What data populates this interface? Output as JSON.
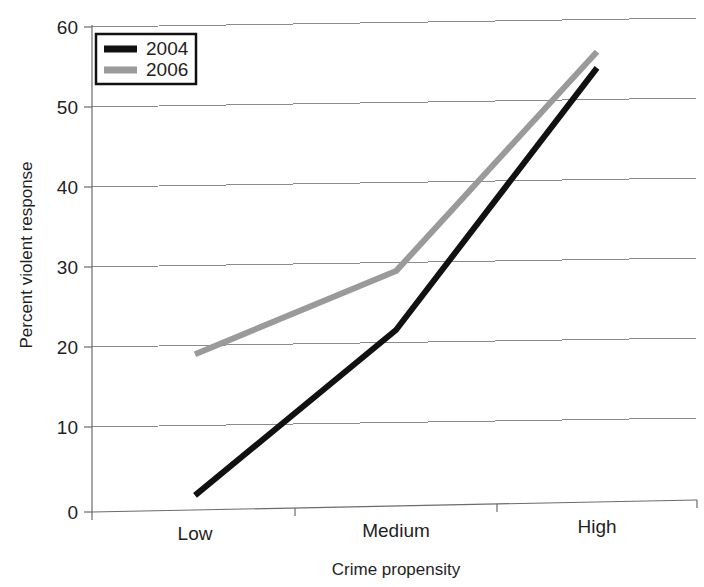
{
  "chart_data": {
    "type": "line",
    "title": "",
    "xlabel": "Crime propensity",
    "ylabel": "Percent violent response",
    "categories": [
      "Low",
      "Medium",
      "High"
    ],
    "ylim": [
      0,
      60
    ],
    "yticks": [
      0,
      10,
      20,
      30,
      40,
      50,
      60
    ],
    "ytick_labels": [
      "0",
      "10",
      "20",
      "30",
      "40",
      "50",
      "60"
    ],
    "grid": true,
    "legend_position": "top-left",
    "series": [
      {
        "name": "2004",
        "color": "#111111",
        "values": [
          2,
          22.5,
          55
        ]
      },
      {
        "name": "2006",
        "color": "#9a9a9a",
        "values": [
          19.5,
          29.8,
          57
        ]
      }
    ]
  },
  "axes": {
    "y_title": "Percent violent response",
    "x_title": "Crime propensity",
    "y_tick_0": "0",
    "y_tick_1": "10",
    "y_tick_2": "20",
    "y_tick_3": "30",
    "y_tick_4": "40",
    "y_tick_5": "50",
    "y_tick_6": "60",
    "x_tick_0": "Low",
    "x_tick_1": "Medium",
    "x_tick_2": "High"
  },
  "legend": {
    "entries": [
      {
        "label": "2004"
      },
      {
        "label": "2006"
      }
    ]
  }
}
